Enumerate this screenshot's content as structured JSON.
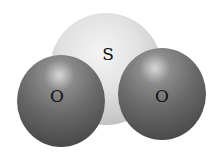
{
  "diagram": {
    "molecule": "space-filling model",
    "atoms": [
      {
        "label": "S",
        "x": 108,
        "y": 54
      },
      {
        "label": "O",
        "x": 57,
        "y": 96
      },
      {
        "label": "O",
        "x": 162,
        "y": 96
      }
    ]
  }
}
